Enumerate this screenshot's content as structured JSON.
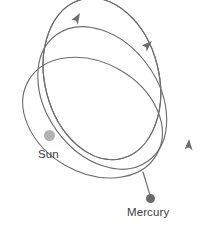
{
  "figure": {
    "width": 209,
    "height": 229,
    "background_color": "#ffffff",
    "orbit_stroke_color": "#6e6e6e",
    "label_text_color": "#3d3d3d"
  },
  "bodies": {
    "sun": {
      "label": "Sun",
      "color": "#b3b3b3",
      "radius_px": 5.5,
      "center": {
        "x": 49.5,
        "y": 135.5
      }
    },
    "mercury": {
      "label": "Mercury",
      "color": "#6b6b6b",
      "radius_px": 4.5,
      "center": {
        "x": 150.5,
        "y": 198.5
      }
    }
  },
  "chart_data": {
    "type": "line",
    "xlabel": "",
    "ylabel": "",
    "grid": false,
    "legend": "none",
    "shared_focus": {
      "x": 49.5,
      "y": 135.5
    },
    "series": [
      {
        "name": "orbit-1",
        "semi_major_px": 68,
        "semi_minor_px": 53,
        "rotation_deg": 2,
        "center": {
          "x": 75,
          "y": 133
        }
      },
      {
        "name": "orbit-2",
        "semi_major_px": 74,
        "semi_minor_px": 55,
        "rotation_deg": 28,
        "center": {
          "x": 92,
          "y": 117
        }
      },
      {
        "name": "orbit-3",
        "semi_major_px": 78,
        "semi_minor_px": 56,
        "rotation_deg": 52,
        "center": {
          "x": 101,
          "y": 97
        }
      },
      {
        "name": "orbit-4",
        "semi_major_px": 82,
        "semi_minor_px": 57,
        "rotation_deg": 74,
        "center": {
          "x": 100,
          "y": 78
        }
      }
    ],
    "arrows": [
      {
        "name": "arrow-top-left",
        "x": 80,
        "y": 13,
        "angle_deg": -58
      },
      {
        "name": "arrow-top-right",
        "x": 152,
        "y": 41,
        "angle_deg": -42
      },
      {
        "name": "arrow-right",
        "x": 189,
        "y": 139,
        "angle_deg": -86
      }
    ]
  }
}
